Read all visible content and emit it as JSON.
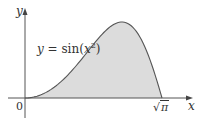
{
  "chart_data": {
    "type": "area",
    "title": "",
    "function_label": "y = sin(x²)",
    "function_label_parts": {
      "lhs": "y",
      "eq": " = sin(",
      "var": "x",
      "exp": "2",
      "close": ")"
    },
    "xlabel": "x",
    "ylabel": "y",
    "x_ticks": [
      {
        "value": 0,
        "label": "0"
      },
      {
        "value": 1.7725,
        "label": "√π"
      }
    ],
    "xlim": [
      -0.22,
      2.17
    ],
    "ylim": [
      -0.05,
      1.15
    ],
    "grid": false,
    "legend": "none",
    "shaded_region": {
      "from": 0,
      "to": 1.7725,
      "description": "area under y = sin(x²) from 0 to √π"
    },
    "series": [
      {
        "name": "y = sin(x²)",
        "x": [
          0,
          0.2,
          0.4,
          0.6,
          0.8,
          1.0,
          1.1,
          1.2,
          1.2533,
          1.3,
          1.4,
          1.5,
          1.6,
          1.7,
          1.7725
        ],
        "y": [
          0,
          0.04,
          0.1593,
          0.3523,
          0.5972,
          0.8415,
          0.9356,
          0.9915,
          1.0,
          0.9929,
          0.9253,
          0.7781,
          0.5487,
          0.253,
          0
        ]
      }
    ],
    "colors": {
      "fill": "#dcdcdc",
      "curve": "#555555",
      "axis": "#555555"
    }
  },
  "labels": {
    "zero": "0",
    "sqrt_pi_radical": "√",
    "sqrt_pi_symbol": "π",
    "x_axis": "x",
    "y_axis": "y"
  }
}
